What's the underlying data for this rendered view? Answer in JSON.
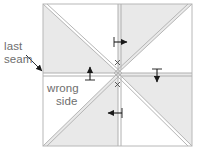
{
  "figure": {
    "type": "sewing-folding-diagram",
    "background_color": "#ffffff",
    "outline_color": "#b3b3b3",
    "shade_color": "#e8e8e8",
    "arrow_color": "#1a1a1a",
    "text_color": "#6e6e6e"
  },
  "labels": {
    "last_seam_line1": "last",
    "last_seam_line2": "seam",
    "wrong_side_line1": "wrong",
    "wrong_side_line2": "side",
    "x_mark_top": "x",
    "x_mark_bottom": "x"
  },
  "square": {
    "left": 43,
    "top": 4,
    "right": 192,
    "bottom": 146,
    "center_x": 118,
    "center_y": 73
  },
  "arrows": [
    {
      "name": "arrow-right-top",
      "direction": "right",
      "x": 122,
      "y": 42
    },
    {
      "name": "arrow-up-left",
      "direction": "up",
      "x": 90,
      "y": 72
    },
    {
      "name": "arrow-down-right",
      "direction": "down",
      "x": 157,
      "y": 76
    },
    {
      "name": "arrow-left-bottom",
      "direction": "left",
      "x": 113,
      "y": 113
    },
    {
      "name": "arrow-pointer-last-seam",
      "direction": "down-right",
      "x": 41,
      "y": 70
    }
  ],
  "shaded_triangles": [
    "top-left-quadrant-lower-triangle",
    "top-right-quadrant-upper-triangle",
    "bottom-left-quadrant-right-triangle",
    "bottom-right-quadrant-right-triangle"
  ]
}
